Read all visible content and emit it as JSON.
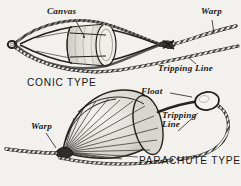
{
  "figure": {
    "background_color": "#f2f1ee",
    "ink_color": "#1a1a18",
    "width": 241,
    "height": 186
  },
  "diagrams": [
    {
      "id": "conic",
      "caption": "CONIC TYPE",
      "caption_style": "caps",
      "labels": [
        {
          "name": "canvas",
          "text": "Canvas",
          "x": 47,
          "y": 8
        },
        {
          "name": "warp",
          "text": "Warp",
          "x": 202,
          "y": 8
        },
        {
          "name": "tripping-line",
          "text": "Tripping Line",
          "x": 160,
          "y": 66
        }
      ],
      "caption_pos": {
        "x": 28,
        "y": 80
      },
      "parts": [
        "canvas band",
        "net bridles",
        "towing ring",
        "splice knot",
        "warp rope",
        "tripping line"
      ]
    },
    {
      "id": "parachute",
      "caption": "PARACHUTE TYPE",
      "caption_style": "caps",
      "labels": [
        {
          "name": "float",
          "text": "Float",
          "x": 142,
          "y": 89
        },
        {
          "name": "tripping-line",
          "text": "Tripping\nLine",
          "x": 163,
          "y": 114
        },
        {
          "name": "warp",
          "text": "Warp",
          "x": 32,
          "y": 124
        }
      ],
      "caption_pos": {
        "x": 141,
        "y": 158
      },
      "parts": [
        "canopy gores",
        "float",
        "bridle apex",
        "tripping line",
        "warp rope"
      ]
    }
  ],
  "icons": {
    "rope": "braided-rope-icon",
    "float": "oval-float-icon",
    "canopy": "parachute-canopy-icon",
    "conic_net": "conic-net-icon"
  }
}
